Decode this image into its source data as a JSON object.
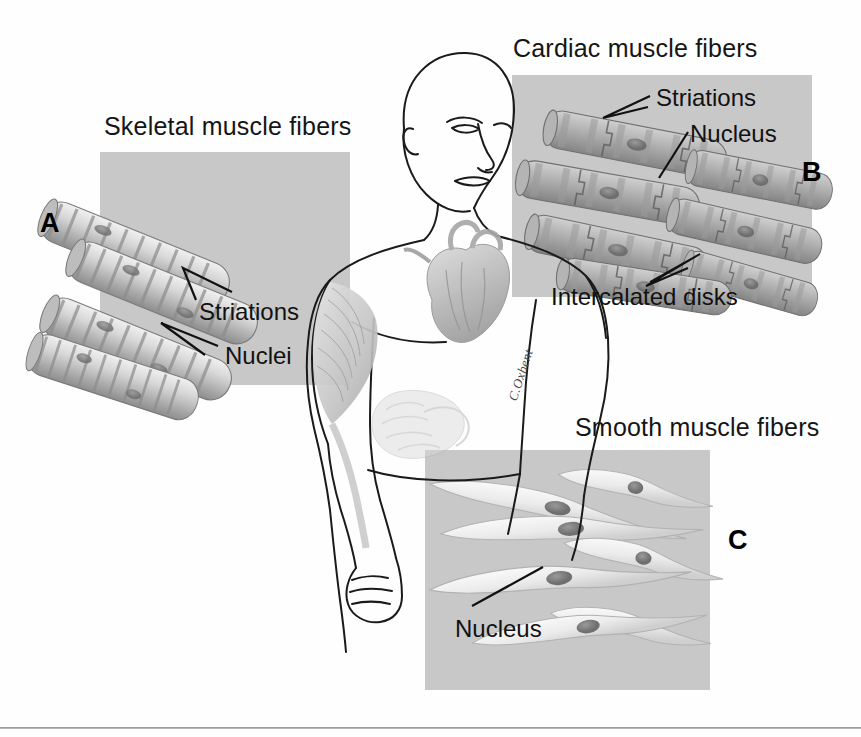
{
  "figure": {
    "background_color": "#fefefe",
    "panel_color": "#c8c8c8",
    "line_color": "#111111"
  },
  "panels": [
    {
      "letter": "A",
      "caption": "Skeletal muscle fibers",
      "annotations": [
        "Striations",
        "Nuclei"
      ],
      "tissue": "skeletal"
    },
    {
      "letter": "B",
      "caption": "Cardiac muscle fibers",
      "annotations": [
        "Striations",
        "Nucleus",
        "Intercalated disks"
      ],
      "tissue": "cardiac"
    },
    {
      "letter": "C",
      "caption": "Smooth muscle fibers",
      "annotations": [
        "Nucleus"
      ],
      "tissue": "smooth"
    }
  ],
  "labels": {
    "skeletal_caption": "Skeletal muscle fibers",
    "cardiac_caption": "Cardiac muscle fibers",
    "smooth_caption": "Smooth muscle fibers",
    "striations_a": "Striations",
    "nuclei_a": "Nuclei",
    "striations_b": "Striations",
    "nucleus_b": "Nucleus",
    "intercalated_disks": "Intercalated disks",
    "nucleus_c": "Nucleus",
    "letter_a": "A",
    "letter_b": "B",
    "letter_c": "C",
    "signature": "C.Oxbent"
  },
  "body_figure": {
    "description": "Anterior view line drawing of a human torso, head turned to the viewer's right, showing the heart in the chest, a shaded skeletal muscle on the left arm and shoulder, and shaded smooth-muscle viscera in the abdomen."
  }
}
